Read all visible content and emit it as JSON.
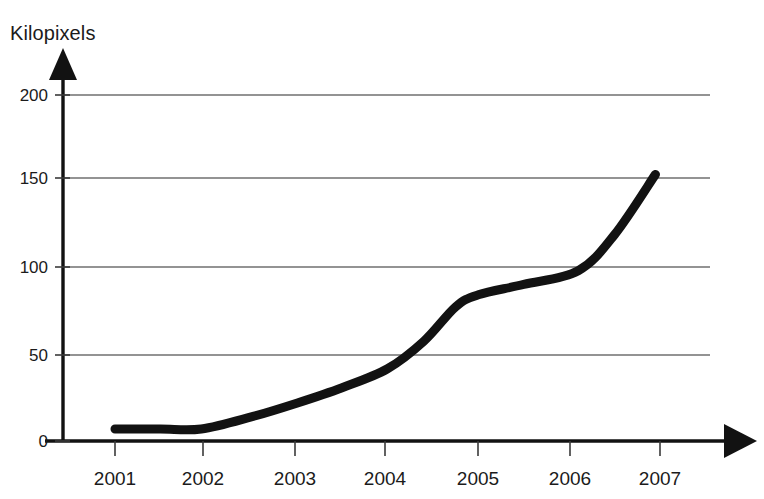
{
  "chart_data": {
    "type": "line",
    "title": "",
    "subtitle": "",
    "xlabel": "",
    "ylabel": "Kilopixels",
    "x": [
      2001,
      2002,
      2003,
      2004,
      2005,
      2006,
      2007
    ],
    "categories": [
      "2001",
      "2002",
      "2003",
      "2004",
      "2005",
      "2006",
      "2007"
    ],
    "values": [
      7,
      7,
      22,
      42,
      85,
      96,
      155
    ],
    "series": [
      {
        "name": "Kilopixels",
        "values": [
          7,
          7,
          22,
          42,
          85,
          96,
          155
        ],
        "color": "#121212",
        "line_width": 9
      }
    ],
    "points": [
      {
        "x": 2001.0,
        "y": 7
      },
      {
        "x": 2001.5,
        "y": 7
      },
      {
        "x": 2001.95,
        "y": 7
      },
      {
        "x": 2002.5,
        "y": 14
      },
      {
        "x": 2003.0,
        "y": 22
      },
      {
        "x": 2003.5,
        "y": 31
      },
      {
        "x": 2004.0,
        "y": 42
      },
      {
        "x": 2004.4,
        "y": 58
      },
      {
        "x": 2004.75,
        "y": 78
      },
      {
        "x": 2005.0,
        "y": 85
      },
      {
        "x": 2005.5,
        "y": 91
      },
      {
        "x": 2006.1,
        "y": 99
      },
      {
        "x": 2006.5,
        "y": 120
      },
      {
        "x": 2006.95,
        "y": 155
      }
    ],
    "ylim": [
      0,
      210
    ],
    "xlim": [
      2000.45,
      2007.55
    ],
    "yticks": [
      0,
      50,
      100,
      150,
      200
    ],
    "ytick_labels": [
      "0",
      "50",
      "100",
      "150",
      "200"
    ],
    "xticks": [
      2001,
      2002,
      2003,
      2004,
      2005,
      2006,
      2007
    ],
    "grid": {
      "horizontal": true,
      "vertical": false,
      "color": "#6f6f6f"
    },
    "legend": {
      "visible": false,
      "position": "none"
    },
    "axis_style": {
      "arrow_heads": true,
      "axis_color": "#121212",
      "background": "#ffffff"
    }
  },
  "yticks": [
    {
      "label": "200",
      "y": 95
    },
    {
      "label": "150",
      "y": 178
    },
    {
      "label": "100",
      "y": 267
    },
    {
      "label": "50",
      "y": 355
    },
    {
      "label": "0",
      "y": 441
    }
  ],
  "xticks": [
    {
      "label": "2001",
      "x": 115
    },
    {
      "label": "2002",
      "x": 203
    },
    {
      "label": "2003",
      "x": 295
    },
    {
      "label": "2004",
      "x": 385
    },
    {
      "label": "2005",
      "x": 478
    },
    {
      "label": "2006",
      "x": 570
    },
    {
      "label": "2007",
      "x": 660
    }
  ]
}
